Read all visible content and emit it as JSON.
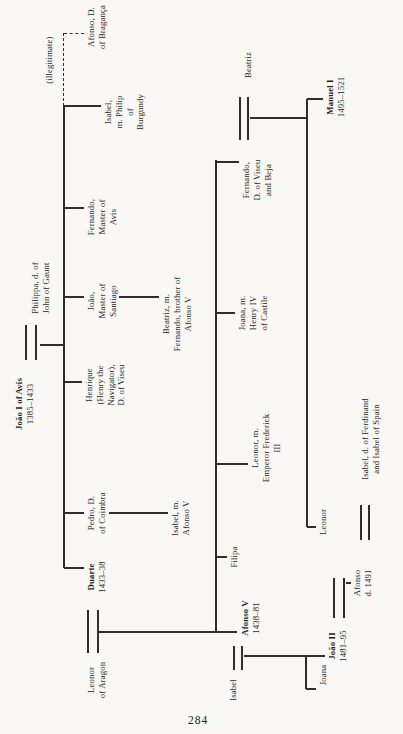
{
  "page": {
    "number": "284"
  },
  "colors": {
    "paper": "#f9f8f4",
    "ink": "#1f1f1f",
    "line": "#2e2e2e"
  },
  "chart_data": {
    "type": "family-tree",
    "people": [
      {
        "id": "joao-i",
        "lines": [
          "João I of Avis",
          "1385–1433"
        ],
        "bold": [
          0
        ],
        "cx": 330,
        "top": 14,
        "w": 92
      },
      {
        "id": "philippa",
        "lines": [
          "Philippa, d. of",
          "John of Gaunt"
        ],
        "bold": [],
        "cx": 446,
        "top": 30,
        "w": 92
      },
      {
        "id": "illegitimate-label",
        "lines": [
          "(illegitimate)"
        ],
        "bold": [],
        "cx": 674,
        "top": 44,
        "w": 92
      },
      {
        "id": "leonor-aragon",
        "lines": [
          "Leonor",
          "of Aragon"
        ],
        "bold": [],
        "cx": 54,
        "top": 86,
        "w": 92
      },
      {
        "id": "duarte",
        "lines": [
          "Duarte",
          "1433–38"
        ],
        "bold": [
          0
        ],
        "cx": 157,
        "top": 86,
        "w": 92
      },
      {
        "id": "pedro",
        "lines": [
          "Pedro, D.",
          "of Coimbra"
        ],
        "bold": [],
        "cx": 221,
        "top": 86,
        "w": 92
      },
      {
        "id": "henrique",
        "lines": [
          "Henrique",
          "(Henry the",
          "Navigator),",
          "D. of Viseu"
        ],
        "bold": [],
        "cx": 349,
        "top": 84,
        "w": 92
      },
      {
        "id": "joao-santiago",
        "lines": [
          "João,",
          "Master of",
          "Santiago"
        ],
        "bold": [],
        "cx": 433,
        "top": 86,
        "w": 92
      },
      {
        "id": "fernando-avis",
        "lines": [
          "Fernando,",
          "Master of",
          "Avis"
        ],
        "bold": [],
        "cx": 517,
        "top": 86,
        "w": 92
      },
      {
        "id": "isabel-burgundy",
        "lines": [
          "Isabel,",
          "m. Philip",
          "of",
          "Burgundy"
        ],
        "bold": [],
        "cx": 622,
        "top": 103,
        "w": 92
      },
      {
        "id": "afonso-braganca",
        "lines": [
          "Afonso, D.",
          "of Bragança"
        ],
        "bold": [],
        "cx": 707,
        "top": 86,
        "w": 92
      },
      {
        "id": "isabel-m-afonso-v",
        "lines": [
          "Isabel, m.",
          "Afonso V"
        ],
        "bold": [],
        "cx": 216,
        "top": 170,
        "w": 92
      },
      {
        "id": "beatriz-m-fernando",
        "lines": [
          "Beatriz, m.",
          "Fernando, brother of",
          "Afonso V"
        ],
        "bold": [],
        "cx": 420,
        "top": 161,
        "w": 100
      },
      {
        "id": "isabel-wife-afonso-v",
        "lines": [
          "Isabel"
        ],
        "bold": [],
        "cx": 44,
        "top": 228,
        "w": 80
      },
      {
        "id": "afonso-v",
        "lines": [
          "Afonso V",
          "1438–81"
        ],
        "bold": [
          0
        ],
        "cx": 116,
        "top": 240,
        "w": 92
      },
      {
        "id": "filipa",
        "lines": [
          "Filipa"
        ],
        "bold": [],
        "cx": 177,
        "top": 229,
        "w": 80
      },
      {
        "id": "leonor-empress",
        "lines": [
          "Leonor, m.",
          "Emperor Frederick",
          "III"
        ],
        "bold": [],
        "cx": 286,
        "top": 250,
        "w": 92
      },
      {
        "id": "joana-castile",
        "lines": [
          "Joana, m.",
          "Henry IV",
          "of Castile"
        ],
        "bold": [],
        "cx": 421,
        "top": 237,
        "w": 92
      },
      {
        "id": "fernando-viseu",
        "lines": [
          "Fernando,",
          "D. of Viseu",
          "and Beja"
        ],
        "bold": [],
        "cx": 554,
        "top": 241,
        "w": 92
      },
      {
        "id": "beatriz-wife",
        "lines": [
          "Beatriz"
        ],
        "bold": [],
        "cx": 669,
        "top": 243,
        "w": 80
      },
      {
        "id": "joana",
        "lines": [
          "Joana"
        ],
        "bold": [],
        "cx": 59,
        "top": 318,
        "w": 70
      },
      {
        "id": "joao-ii",
        "lines": [
          "João II",
          "1481–95"
        ],
        "bold": [
          0
        ],
        "cx": 88,
        "top": 327,
        "w": 92
      },
      {
        "id": "leonor-wife-joao-ii",
        "lines": [
          "Leonor"
        ],
        "bold": [],
        "cx": 212,
        "top": 318,
        "w": 80
      },
      {
        "id": "manuel-i",
        "lines": [
          "Manuel I",
          "1495–1521"
        ],
        "bold": [
          0
        ],
        "cx": 637,
        "top": 325,
        "w": 92
      },
      {
        "id": "afonso-d-1491",
        "lines": [
          "Afonso",
          "d. 1491"
        ],
        "bold": [],
        "cx": 151,
        "top": 352,
        "w": 80
      },
      {
        "id": "isabel-spain",
        "lines": [
          "Isabel, d. of Ferdinand",
          "and Isabel of Spain"
        ],
        "bold": [],
        "cx": 295,
        "top": 360,
        "w": 112
      }
    ],
    "marriages": [
      {
        "id": "joao-i--philippa",
        "x1": 374,
        "x2": 409,
        "y1": 26,
        "y2": 36
      },
      {
        "id": "leonor-aragon--duarte",
        "x1": 81,
        "x2": 124,
        "y1": 88,
        "y2": 98
      },
      {
        "id": "isabel--afonso-v",
        "x1": 64,
        "x2": 88,
        "y1": 234,
        "y2": 242
      },
      {
        "id": "fernando-viseu--beatriz",
        "x1": 594,
        "x2": 637,
        "y1": 240,
        "y2": 248
      },
      {
        "id": "joao-ii--leonor",
        "x1": 116,
        "x2": 156,
        "y1": 334,
        "y2": 344
      },
      {
        "id": "afonso--isabel-spain",
        "x1": 194,
        "x2": 229,
        "y1": 361,
        "y2": 369
      }
    ],
    "connectors": [
      {
        "x1": 389,
        "y1": 40,
        "x2": 389,
        "y2": 64
      },
      {
        "x1": 166,
        "y1": 64,
        "x2": 628,
        "y2": 64
      },
      {
        "x1": 166,
        "y1": 64,
        "x2": 166,
        "y2": 84
      },
      {
        "x1": 221,
        "y1": 64,
        "x2": 221,
        "y2": 84
      },
      {
        "x1": 352,
        "y1": 64,
        "x2": 352,
        "y2": 82
      },
      {
        "x1": 437,
        "y1": 64,
        "x2": 437,
        "y2": 84
      },
      {
        "x1": 526,
        "y1": 64,
        "x2": 526,
        "y2": 84
      },
      {
        "x1": 628,
        "y1": 64,
        "x2": 628,
        "y2": 101
      },
      {
        "x1": 628,
        "y1": 64,
        "x2": 701,
        "y2": 64,
        "dashed": true
      },
      {
        "x1": 701,
        "y1": 64,
        "x2": 701,
        "y2": 84,
        "dashed": true
      },
      {
        "x1": 221,
        "y1": 109,
        "x2": 221,
        "y2": 168
      },
      {
        "x1": 437,
        "y1": 119,
        "x2": 437,
        "y2": 159
      },
      {
        "x1": 102,
        "y1": 98,
        "x2": 102,
        "y2": 216
      },
      {
        "x1": 102,
        "y1": 216,
        "x2": 574,
        "y2": 216
      },
      {
        "x1": 102,
        "y1": 216,
        "x2": 102,
        "y2": 237
      },
      {
        "x1": 177,
        "y1": 216,
        "x2": 177,
        "y2": 227
      },
      {
        "x1": 270,
        "y1": 216,
        "x2": 270,
        "y2": 248
      },
      {
        "x1": 421,
        "y1": 216,
        "x2": 421,
        "y2": 235
      },
      {
        "x1": 572,
        "y1": 216,
        "x2": 572,
        "y2": 239
      },
      {
        "x1": 78,
        "y1": 244,
        "x2": 78,
        "y2": 325
      },
      {
        "x1": 45,
        "y1": 306,
        "x2": 78,
        "y2": 306
      },
      {
        "x1": 45,
        "y1": 306,
        "x2": 45,
        "y2": 316
      },
      {
        "x1": 616,
        "y1": 250,
        "x2": 616,
        "y2": 307
      },
      {
        "x1": 207,
        "y1": 307,
        "x2": 635,
        "y2": 307
      },
      {
        "x1": 207,
        "y1": 307,
        "x2": 207,
        "y2": 316
      },
      {
        "x1": 635,
        "y1": 307,
        "x2": 635,
        "y2": 323
      },
      {
        "x1": 151,
        "y1": 346,
        "x2": 151,
        "y2": 351
      }
    ]
  }
}
